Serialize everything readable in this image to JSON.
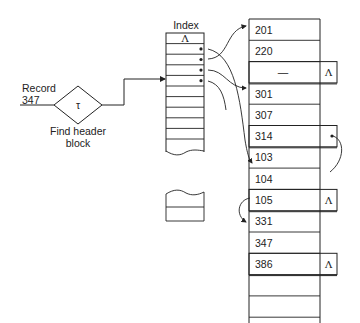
{
  "input": {
    "label_line1": "Record",
    "label_line2": "347"
  },
  "hash": {
    "symbol": "τ",
    "caption_line1": "Find header",
    "caption_line2": "block"
  },
  "index": {
    "title": "Index",
    "first_cell": "Λ",
    "pointer_rows": [
      1,
      2,
      3,
      4
    ]
  },
  "blocks": {
    "rows": [
      {
        "value": "201",
        "overflow": false,
        "tag": ""
      },
      {
        "value": "220",
        "overflow": false,
        "tag": ""
      },
      {
        "value": "—",
        "overflow": true,
        "tag": "Λ"
      },
      {
        "value": "301",
        "overflow": false,
        "tag": ""
      },
      {
        "value": "307",
        "overflow": false,
        "tag": ""
      },
      {
        "value": "314",
        "overflow": true,
        "tag": "•"
      },
      {
        "value": "103",
        "overflow": false,
        "tag": ""
      },
      {
        "value": "104",
        "overflow": false,
        "tag": ""
      },
      {
        "value": "105",
        "overflow": true,
        "tag": "Λ"
      },
      {
        "value": "331",
        "overflow": false,
        "tag": ""
      },
      {
        "value": "347",
        "overflow": false,
        "tag": ""
      },
      {
        "value": "386",
        "overflow": true,
        "tag": "Λ"
      },
      {
        "value": "",
        "overflow": false,
        "tag": ""
      },
      {
        "value": "",
        "overflow": false,
        "tag": ""
      }
    ]
  },
  "colors": {
    "ink": "#222222",
    "background": "#ffffff"
  }
}
